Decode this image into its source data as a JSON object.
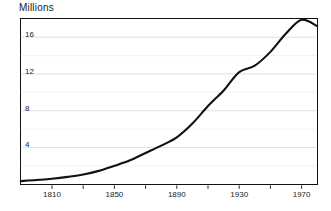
{
  "chart_data": {
    "type": "line",
    "title": "Millions",
    "xlabel": "",
    "ylabel": "Millions",
    "xlim": [
      1790,
      1980
    ],
    "ylim": [
      0,
      18
    ],
    "grid": true,
    "legend": "none",
    "y_ticks_labeled": [
      4,
      8,
      12,
      16
    ],
    "y_gridlines": [
      2,
      4,
      6,
      8,
      10,
      12,
      14,
      16
    ],
    "y_tick_labels": [
      "4",
      "8",
      "12",
      "16"
    ],
    "x_ticks": [
      1810,
      1830,
      1850,
      1870,
      1890,
      1910,
      1930,
      1950,
      1970
    ],
    "x_ticks_labeled": [
      1810,
      1850,
      1890,
      1930,
      1970
    ],
    "x_tick_labels": [
      "1810",
      "1850",
      "1890",
      "1930",
      "1970"
    ],
    "series": [
      {
        "name": "Population",
        "color": "#111111",
        "x": [
          1790,
          1800,
          1810,
          1820,
          1830,
          1840,
          1850,
          1860,
          1870,
          1880,
          1890,
          1900,
          1910,
          1920,
          1930,
          1940,
          1950,
          1960,
          1970,
          1980
        ],
        "values": [
          0.34,
          0.45,
          0.6,
          0.8,
          1.05,
          1.45,
          2.0,
          2.6,
          3.4,
          4.2,
          5.1,
          6.6,
          8.5,
          10.2,
          12.2,
          12.9,
          14.4,
          16.4,
          17.9,
          17.2
        ]
      }
    ]
  },
  "axis": {
    "y_labels": [
      {
        "text": "16",
        "value": 16
      },
      {
        "text": "12",
        "value": 12
      },
      {
        "text": "8",
        "value": 8
      },
      {
        "text": "4",
        "value": 4
      }
    ],
    "x_labels": [
      {
        "text": "1810",
        "value": 1810
      },
      {
        "text": "1850",
        "value": 1850
      },
      {
        "text": "1890",
        "value": 1890
      },
      {
        "text": "1930",
        "value": 1930
      },
      {
        "text": "1970",
        "value": 1970
      }
    ]
  },
  "colors": {
    "line": "#111111",
    "grid": "#d8d8d8",
    "frame": "#111111",
    "text": "#1a1a1a",
    "background": "#ffffff"
  }
}
